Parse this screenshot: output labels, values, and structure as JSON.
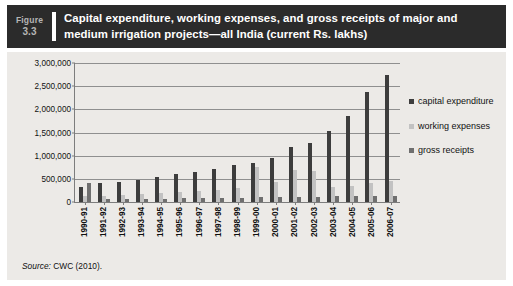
{
  "figure": {
    "tag_word": "Figure",
    "tag_number": "3.3",
    "title": "Capital expenditure, working expenses, and gross receipts of major and medium irrigation projects—all India (current Rs. lakhs)",
    "source_prefix": "Source:",
    "source_text": "CWC (2010)."
  },
  "colors": {
    "header_background": "#2b2b2b",
    "header_text": "#ffffff",
    "panel_background": "#eceae7",
    "capital_expenditure": "#3d3d3d",
    "working_expenses": "#c2c2c2",
    "gross_receipts": "#6f6f6f",
    "gridline": "#8f8f8f",
    "axis": "#7d7d7d"
  },
  "chart_data": {
    "type": "bar",
    "title": "Capital expenditure, working expenses, and gross receipts of major and medium irrigation projects—all India (current Rs. lakhs)",
    "xlabel": "",
    "ylabel": "",
    "ylim": [
      0,
      3000000
    ],
    "yticks": [
      0,
      500000,
      1000000,
      1500000,
      2000000,
      2500000,
      3000000
    ],
    "ytick_labels": [
      "0",
      "500,000",
      "1,000,000",
      "1,500,000",
      "2,000,000",
      "2,500,000",
      "3,000,000"
    ],
    "grid": true,
    "legend_position": "right",
    "categories": [
      "1990-91",
      "1991-92",
      "1992-93",
      "1993-94",
      "1994-95",
      "1995-96",
      "1996-97",
      "1997-98",
      "1998-99",
      "1999-00",
      "2000-01",
      "2001-02",
      "2002-03",
      "2003-04",
      "2004-05",
      "2005-06",
      "2006-07"
    ],
    "series": [
      {
        "name": "capital expenditure",
        "color": "#3d3d3d",
        "values": [
          330000,
          400000,
          430000,
          470000,
          540000,
          600000,
          640000,
          720000,
          800000,
          850000,
          950000,
          1180000,
          1280000,
          1540000,
          1860000,
          2380000,
          2750000
        ]
      },
      {
        "name": "working expenses",
        "color": "#c2c2c2",
        "values": [
          130000,
          140000,
          150000,
          170000,
          190000,
          210000,
          240000,
          270000,
          300000,
          760000,
          430000,
          700000,
          680000,
          330000,
          350000,
          400000,
          450000
        ]
      },
      {
        "name": "gross receipts",
        "color": "#6f6f6f",
        "values": [
          410000,
          60000,
          65000,
          70000,
          75000,
          80000,
          85000,
          90000,
          95000,
          100000,
          105000,
          110000,
          115000,
          120000,
          120000,
          125000,
          130000
        ]
      }
    ]
  },
  "legend": {
    "items": [
      {
        "label": "capital expenditure",
        "series": "capital expenditure"
      },
      {
        "label": "working expenses",
        "series": "working expenses"
      },
      {
        "label": "gross receipts",
        "series": "gross receipts"
      }
    ]
  }
}
